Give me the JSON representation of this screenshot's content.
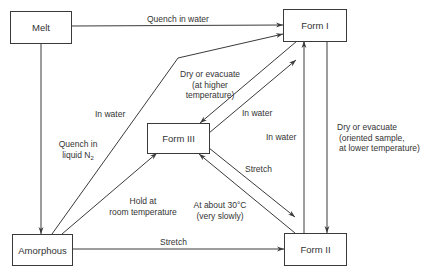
{
  "diagram": {
    "nodes": {
      "melt": "Melt",
      "form1": "Form I",
      "form3": "Form III",
      "form2": "Form II",
      "amorphous": "Amorphous"
    },
    "edges": [
      {
        "from": "Melt",
        "to": "Form I",
        "label": "Quench in water"
      },
      {
        "from": "Melt",
        "to": "Amorphous",
        "label": "Quench in liquid N2"
      },
      {
        "from": "Amorphous",
        "to": "Form I",
        "label": "In water"
      },
      {
        "from": "Form I",
        "to": "Form III",
        "label": "Dry or evacuate (at higher temperature)"
      },
      {
        "from": "Form III",
        "to": "Form I",
        "label": "In water"
      },
      {
        "from": "Form II",
        "to": "Form I",
        "label": "In water"
      },
      {
        "from": "Form I",
        "to": "Form II",
        "label": "Dry or evacuate (oriented sample, at lower temperature)"
      },
      {
        "from": "Amorphous",
        "to": "Form III",
        "label": "Hold at room temperature"
      },
      {
        "from": "Form III",
        "to": "Form II",
        "label": "Stretch"
      },
      {
        "from": "Form II",
        "to": "Form III",
        "label": "At about 30°C (very slowly)"
      },
      {
        "from": "Amorphous",
        "to": "Form II",
        "label": "Stretch"
      }
    ],
    "labels": {
      "quench_water": "Quench in water",
      "quench_n2_l1": "Quench in",
      "quench_n2_l2": "liquid N",
      "quench_n2_sub": "2",
      "in_water_left": "In water",
      "dry_high_l1": "Dry or evacuate",
      "dry_high_l2": "(at higher",
      "dry_high_l3": "temperature)",
      "in_water_diag": "In water",
      "in_water_vert": "In water",
      "dry_low_l1": "Dry or evacuate",
      "dry_low_l2": "(oriented sample,",
      "dry_low_l3": "at lower temperature)",
      "hold_l1": "Hold at",
      "hold_l2": "room temperature",
      "stretch_diag": "Stretch",
      "about30_l1": "At about 30°C",
      "about30_l2": "(very slowly)",
      "stretch_bottom": "Stretch"
    },
    "colors": {
      "line": "#3a3a3a",
      "text": "#333333",
      "background": "#ffffff"
    }
  }
}
